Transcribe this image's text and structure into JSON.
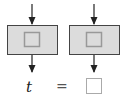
{
  "diagram": {
    "blocks": [
      {
        "name": "left-block",
        "x": 7,
        "y": 25,
        "w": 51,
        "h": 30
      },
      {
        "name": "right-block",
        "x": 69,
        "y": 25,
        "w": 51,
        "h": 30
      }
    ],
    "equation": {
      "variable": "t",
      "operator": "=",
      "result": ""
    },
    "colors": {
      "block_fill": "#dcdcdc",
      "stroke": "#444444",
      "inner_fill": "#dcdcdc",
      "inner_stroke": "#999999",
      "answer_stroke": "#aaaaaa"
    }
  }
}
